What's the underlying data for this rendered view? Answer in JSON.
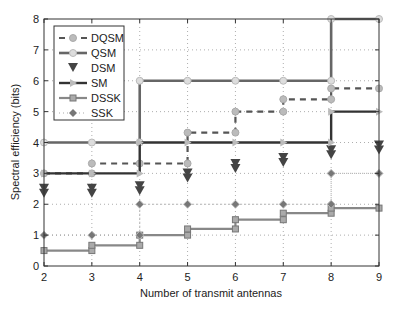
{
  "chart_data": {
    "type": "line",
    "title": "",
    "xlabel": "Number of transmit antennas",
    "ylabel": "Spectral efficiency (bits)",
    "xlim": [
      2,
      9
    ],
    "ylim": [
      0,
      8
    ],
    "xticks": [
      2,
      3,
      4,
      5,
      6,
      7,
      8,
      9
    ],
    "yticks": [
      0,
      1,
      2,
      3,
      4,
      5,
      6,
      7,
      8
    ],
    "grid": true,
    "legend_position": "upper left",
    "x": [
      2,
      3,
      4,
      5,
      6,
      7,
      8,
      9
    ],
    "series": [
      {
        "name": "DQSM",
        "style": "dashed",
        "marker": "circle",
        "step": true,
        "values": [
          3,
          3.32,
          3.32,
          4.32,
          5,
          5.4,
          5.75,
          5.75
        ]
      },
      {
        "name": "QSM",
        "style": "solid",
        "marker": "star",
        "step": true,
        "values": [
          4,
          4,
          6,
          6,
          6,
          6,
          8,
          8
        ]
      },
      {
        "name": "DSM",
        "style": "none",
        "marker": "triangle-down",
        "step": false,
        "values": [
          2.5,
          2.5,
          2.58,
          3.0,
          3.3,
          3.5,
          3.75,
          3.9
        ]
      },
      {
        "name": "SM",
        "style": "solid",
        "marker": "triangle-right",
        "step": true,
        "values": [
          3,
          3,
          4,
          4,
          4,
          4,
          5,
          5
        ]
      },
      {
        "name": "DSSK",
        "style": "solid",
        "marker": "square",
        "step": true,
        "values": [
          0.5,
          0.67,
          1,
          1.2,
          1.5,
          1.71,
          1.875,
          1.875
        ]
      },
      {
        "name": "SSK",
        "style": "dashdot",
        "marker": "diamond",
        "step": true,
        "values": [
          1,
          1,
          2,
          2,
          2,
          2,
          3,
          3
        ]
      }
    ]
  },
  "legend": {
    "items": [
      "DQSM",
      "QSM",
      "DSM",
      "SM",
      "DSSK",
      "SSK"
    ]
  },
  "axes": {
    "xlabel": "Number of transmit antennas",
    "ylabel": "Spectral efficiency (bits)",
    "xtick_labels": [
      "2",
      "3",
      "4",
      "5",
      "6",
      "7",
      "8",
      "9"
    ],
    "ytick_labels": [
      "0",
      "1",
      "2",
      "3",
      "4",
      "5",
      "6",
      "7",
      "8"
    ]
  }
}
